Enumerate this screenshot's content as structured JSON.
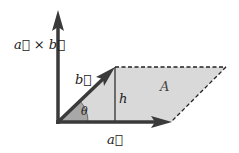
{
  "diagram": {
    "labels": {
      "cross_product": "a⃗ × b⃗",
      "vector_a": "a⃗",
      "vector_b": "b⃗",
      "height": "h",
      "area": "A",
      "angle": "θ"
    },
    "colors": {
      "arrow": "#3a3a3a",
      "fill": "#d9d9d9",
      "angle_fill": "#a8a8a8",
      "dash": "#222222"
    }
  }
}
